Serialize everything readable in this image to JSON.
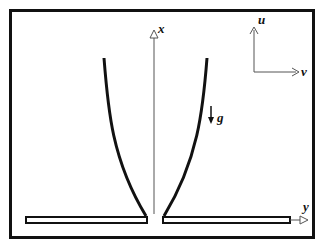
{
  "figure": {
    "type": "schematic",
    "labels": {
      "x_axis": "x",
      "y_axis": "y",
      "u_axis": "u",
      "v_axis": "v",
      "gravity": "g",
      "gravity_arrow": "↓"
    }
  },
  "background_text": [
    "",
    "",
    "",
    "",
    "",
    "",
    "",
    "",
    "",
    "",
    "",
    "",
    "",
    ""
  ]
}
